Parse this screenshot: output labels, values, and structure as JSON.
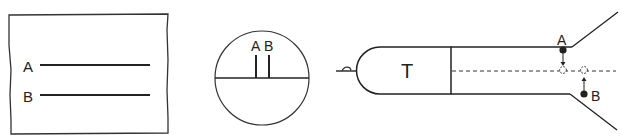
{
  "panels": {
    "film": {
      "line_a_label": "A",
      "line_b_label": "B"
    },
    "circle_view": {
      "tick_a_label": "A",
      "tick_b_label": "B"
    },
    "tube": {
      "body_label": "T",
      "point_a_label": "A",
      "point_b_label": "B"
    }
  },
  "colors": {
    "stroke": "#222222",
    "background": "#ffffff"
  }
}
